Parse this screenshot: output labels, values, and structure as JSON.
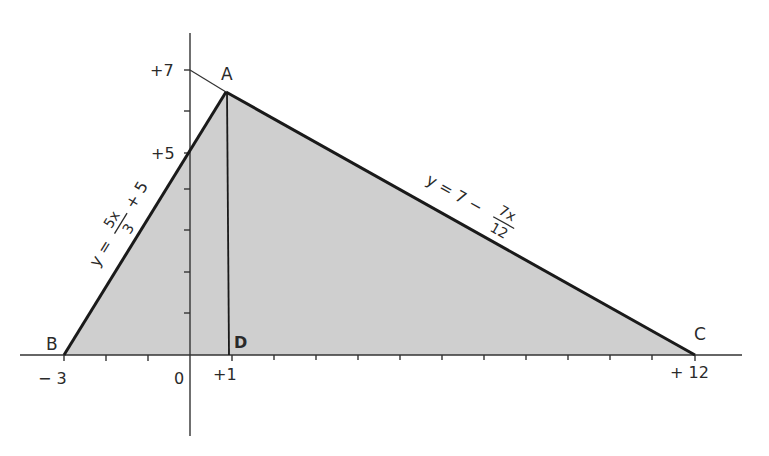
{
  "diagram": {
    "type": "coordinate-geometry-triangle",
    "colors": {
      "background": "#ffffff",
      "fill": "#cfcfcf",
      "ink": "#1a1a1a",
      "axis": "#333333"
    },
    "points": {
      "A": {
        "label": "A",
        "x": 1,
        "y": 6.4167
      },
      "B": {
        "label": "B",
        "x": -3,
        "y": 0
      },
      "C": {
        "label": "C",
        "x": 12,
        "y": 0
      },
      "D": {
        "label": "D",
        "x": 1,
        "y": 0
      }
    },
    "lines": {
      "AB": {
        "eq_prefix": "y =",
        "frac_num": "5x",
        "frac_den": "3",
        "eq_suffix": "+ 5"
      },
      "AC": {
        "eq_prefix": "y = 7 −",
        "frac_num": "7x",
        "frac_den": "12"
      }
    },
    "x_ticks": {
      "minus3": "− 3",
      "zero": "0",
      "plus1": "+1",
      "plus12": "+ 12"
    },
    "y_ticks": {
      "plus5": "+5",
      "plus7": "+7"
    }
  }
}
